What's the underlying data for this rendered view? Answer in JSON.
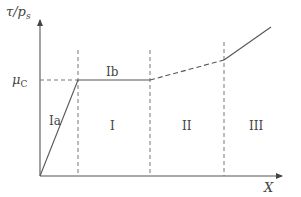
{
  "diagram": {
    "y_axis_label": {
      "main": "τ/p",
      "sub": "s"
    },
    "x_axis_label": "X",
    "mu_label": {
      "main": "μ",
      "sub": "C"
    },
    "regions": [
      {
        "id": "Ia",
        "label": "Ia"
      },
      {
        "id": "Ib",
        "label": "Ib"
      },
      {
        "id": "I",
        "label": "I"
      },
      {
        "id": "II",
        "label": "II"
      },
      {
        "id": "III",
        "label": "III"
      }
    ],
    "colors": {
      "line": "#555555",
      "text": "#444444"
    }
  }
}
